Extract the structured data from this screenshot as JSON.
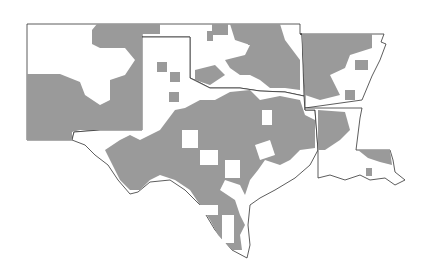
{
  "map": {
    "type": "choropleth",
    "region": "South Central United States",
    "states": [
      "New Mexico",
      "Texas",
      "Oklahoma",
      "Arkansas",
      "Louisiana"
    ],
    "colors": {
      "shaded": "#9a9a9a",
      "unshaded": "#ffffff",
      "border": "#333333",
      "background": "#ffffff"
    },
    "legend": null
  }
}
